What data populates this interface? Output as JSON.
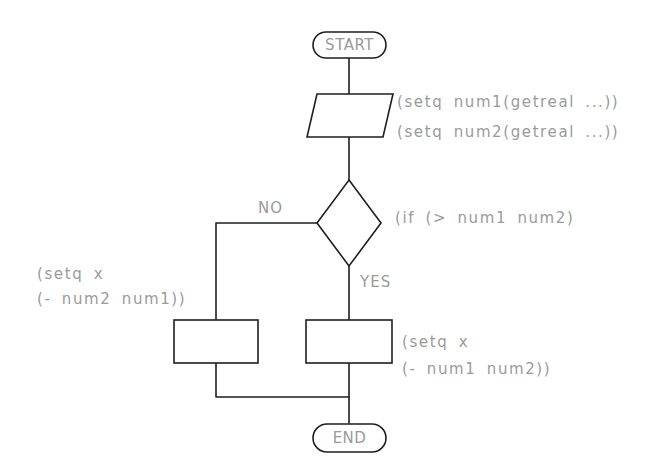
{
  "diagram": {
    "type": "flowchart",
    "nodes": {
      "start": {
        "label": "START",
        "shape": "terminal"
      },
      "input": {
        "shape": "parallelogram",
        "code": [
          "(setq num1(getreal ...))",
          "(setq num2(getreal ...))"
        ]
      },
      "decision": {
        "shape": "diamond",
        "code": "(if (> num1 num2)"
      },
      "process_no": {
        "shape": "rectangle",
        "code": [
          "(setq x",
          "(- num2 num1))"
        ]
      },
      "process_yes": {
        "shape": "rectangle",
        "code": [
          "(setq x",
          "(- num1 num2))"
        ]
      },
      "end": {
        "label": "END",
        "shape": "terminal"
      }
    },
    "branches": {
      "no_label": "NO",
      "yes_label": "YES"
    },
    "edges": [
      {
        "from": "start",
        "to": "input"
      },
      {
        "from": "input",
        "to": "decision"
      },
      {
        "from": "decision",
        "to": "process_no",
        "label": "NO"
      },
      {
        "from": "decision",
        "to": "process_yes",
        "label": "YES"
      },
      {
        "from": "process_no",
        "to": "end"
      },
      {
        "from": "process_yes",
        "to": "end"
      }
    ],
    "colors": {
      "line": "#1e1e1e",
      "text": "#9a9a9a",
      "background": "#ffffff"
    }
  }
}
